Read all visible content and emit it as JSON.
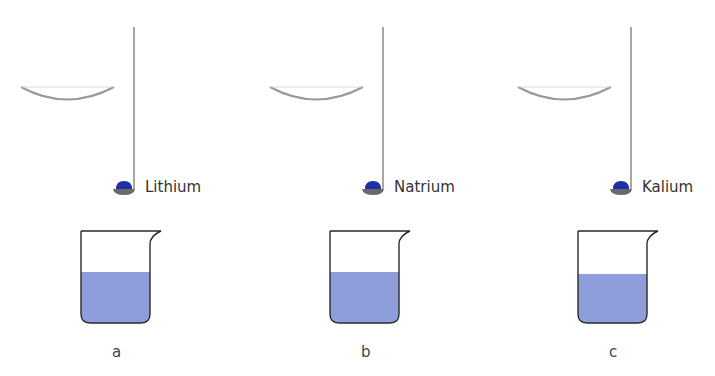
{
  "colors": {
    "line": "#8a8a8a",
    "dish": "#9a9a9a",
    "metal": "#1f2fa8",
    "spoon": "#6a6a6a",
    "water": "#8e9edb",
    "beaker_outline": "#2a2a2a"
  },
  "setups": [
    {
      "id": "a",
      "metal": "Lithium",
      "label": "a",
      "offset_x": 0
    },
    {
      "id": "b",
      "metal": "Natrium",
      "label": "b",
      "offset_x": 249
    },
    {
      "id": "c",
      "metal": "Kalium",
      "label": "c",
      "offset_x": 497
    }
  ]
}
